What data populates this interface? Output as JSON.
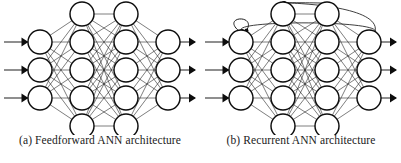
{
  "figure": {
    "background_color": "#ffffff",
    "stroke_color": "#0d0d0d",
    "panels": [
      {
        "id": "a",
        "caption": "(a) Feedforward ANN architecture",
        "network": {
          "type": "feedforward",
          "layers": [
            {
              "name": "input",
              "node_count": 3,
              "cx": 40,
              "cys": [
                42,
                70,
                98
              ]
            },
            {
              "name": "hidden-1",
              "node_count": 5,
              "cx": 82,
              "cys": [
                14,
                42,
                70,
                98,
                126
              ]
            },
            {
              "name": "hidden-2",
              "node_count": 5,
              "cx": 126,
              "cys": [
                14,
                42,
                70,
                98,
                126
              ]
            },
            {
              "name": "output",
              "node_count": 3,
              "cx": 168,
              "cys": [
                42,
                70,
                98
              ]
            }
          ],
          "node_radius": 12,
          "fully_connected": true,
          "input_arrows": 3,
          "output_arrows": 3,
          "self_loops": [],
          "feedback_arcs": []
        }
      },
      {
        "id": "b",
        "caption": "(b) Recurrent ANN architecture",
        "network": {
          "type": "recurrent",
          "layers": [
            {
              "name": "input",
              "node_count": 3,
              "cx": 40,
              "cys": [
                42,
                70,
                98
              ]
            },
            {
              "name": "hidden-1",
              "node_count": 5,
              "cx": 82,
              "cys": [
                14,
                42,
                70,
                98,
                126
              ]
            },
            {
              "name": "hidden-2",
              "node_count": 5,
              "cx": 126,
              "cys": [
                14,
                42,
                70,
                98,
                126
              ]
            },
            {
              "name": "output",
              "node_count": 3,
              "cx": 168,
              "cys": [
                42,
                70,
                98
              ]
            }
          ],
          "node_radius": 12,
          "fully_connected": true,
          "input_arrows": 3,
          "output_arrows": 3,
          "self_loops": [
            {
              "layer": "input",
              "node_index": 0
            },
            {
              "layer": "hidden-2",
              "node_index": 4
            }
          ],
          "feedback_arcs": [
            {
              "from_layer": "output",
              "from_index": 0,
              "to_layer": "input",
              "to_index": 0
            },
            {
              "from_layer": "output",
              "from_index": 0,
              "to_layer": "hidden-1",
              "to_index": 0
            },
            {
              "from_layer": "hidden-2",
              "from_index": 0,
              "to_layer": "hidden-1",
              "to_index": 0
            }
          ]
        }
      }
    ]
  }
}
